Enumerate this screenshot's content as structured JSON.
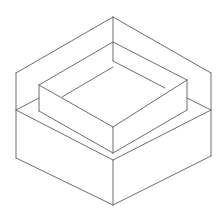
{
  "diagram": {
    "title": "",
    "stroke_color": "#6e6e6e",
    "stroke_width": 1,
    "background": "#ffffff",
    "segments": [
      {
        "name": "outer-top-left-edge",
        "x1": 16,
        "y1": 73,
        "x2": 113,
        "y2": 17
      },
      {
        "name": "outer-top-right-edge",
        "x1": 113,
        "y1": 17,
        "x2": 211,
        "y2": 73
      },
      {
        "name": "back-corner-vertical",
        "x1": 113,
        "y1": 17,
        "x2": 113,
        "y2": 61
      },
      {
        "name": "outer-left-vertical",
        "x1": 16,
        "y1": 73,
        "x2": 16,
        "y2": 158
      },
      {
        "name": "outer-right-vertical",
        "x1": 211,
        "y1": 73,
        "x2": 211,
        "y2": 156
      },
      {
        "name": "inner-wall-left-edge",
        "x1": 39,
        "y1": 85,
        "x2": 113,
        "y2": 42
      },
      {
        "name": "inner-wall-right-edge",
        "x1": 113,
        "y1": 42,
        "x2": 187,
        "y2": 80
      },
      {
        "name": "back-floor-right",
        "x1": 113,
        "y1": 61,
        "x2": 165,
        "y2": 88
      },
      {
        "name": "back-floor-left",
        "x1": 62,
        "y1": 97,
        "x2": 113,
        "y2": 67
      },
      {
        "name": "inner-box-top-left-front",
        "x1": 39,
        "y1": 85,
        "x2": 113,
        "y2": 127
      },
      {
        "name": "inner-box-top-right-front",
        "x1": 113,
        "y1": 127,
        "x2": 187,
        "y2": 80
      },
      {
        "name": "inner-box-left-vertical",
        "x1": 39,
        "y1": 85,
        "x2": 39,
        "y2": 111
      },
      {
        "name": "inner-box-front-vertical",
        "x1": 113,
        "y1": 127,
        "x2": 113,
        "y2": 153
      },
      {
        "name": "inner-box-right-vertical",
        "x1": 187,
        "y1": 80,
        "x2": 187,
        "y2": 110
      },
      {
        "name": "inner-box-bottom-left",
        "x1": 39,
        "y1": 111,
        "x2": 113,
        "y2": 153
      },
      {
        "name": "inner-box-bottom-right",
        "x1": 113,
        "y1": 153,
        "x2": 187,
        "y2": 110
      },
      {
        "name": "ledge-left-back",
        "x1": 16,
        "y1": 110,
        "x2": 39,
        "y2": 98
      },
      {
        "name": "ledge-right-back",
        "x1": 187,
        "y1": 98,
        "x2": 211,
        "y2": 110
      },
      {
        "name": "base-top-left-front",
        "x1": 16,
        "y1": 110,
        "x2": 113,
        "y2": 160
      },
      {
        "name": "base-top-right-front",
        "x1": 113,
        "y1": 160,
        "x2": 211,
        "y2": 110
      },
      {
        "name": "base-front-vertical",
        "x1": 113,
        "y1": 160,
        "x2": 113,
        "y2": 205
      },
      {
        "name": "base-bottom-left",
        "x1": 16,
        "y1": 158,
        "x2": 113,
        "y2": 205
      },
      {
        "name": "base-bottom-right",
        "x1": 113,
        "y1": 205,
        "x2": 211,
        "y2": 156
      }
    ]
  }
}
